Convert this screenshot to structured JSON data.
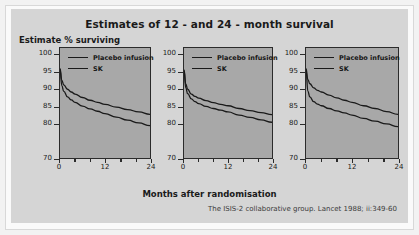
{
  "figure": {
    "title": "Estimates of 12 - and 24 - month survival",
    "ylabel": "Estimate % surviving",
    "xlabel": "Months after randomisation",
    "citation": "The ISIS-2 collaborative group. Lancet 1988; ii:349-60",
    "background_color": "#d5d5d5",
    "plot_background_color": "#a8a8a8",
    "line_color": "#1a1a1a"
  },
  "chart_data": [
    {
      "type": "line",
      "panel": 1,
      "title": "Estimates of 12 - and 24 - month survival",
      "xlabel": "Months after randomisation",
      "ylabel": "Estimate % surviving",
      "xlim": [
        0,
        24
      ],
      "ylim": [
        70,
        102
      ],
      "xticks": [
        0,
        4,
        8,
        12,
        16,
        20,
        24
      ],
      "xticklabels": [
        "0",
        "",
        "",
        "12",
        "",
        "",
        "24"
      ],
      "yticks": [
        70,
        80,
        85,
        90,
        95,
        100
      ],
      "yticklabels": [
        "70",
        "80",
        "85",
        "90",
        "95",
        "100"
      ],
      "grid": false,
      "legend_position": "top-left",
      "series": [
        {
          "name": "Placebo infusion",
          "x": [
            0,
            0.5,
            1,
            2,
            3,
            4,
            6,
            8,
            10,
            12,
            15,
            18,
            21,
            24
          ],
          "values": [
            96.0,
            92.6,
            91.3,
            90.0,
            89.2,
            88.6,
            87.6,
            86.8,
            86.2,
            85.6,
            84.8,
            84.1,
            83.4,
            82.7
          ]
        },
        {
          "name": "SK",
          "x": [
            0,
            0.5,
            1,
            2,
            3,
            4,
            6,
            8,
            10,
            12,
            15,
            18,
            21,
            24
          ],
          "values": [
            95.8,
            91.0,
            89.4,
            87.8,
            86.9,
            86.2,
            85.1,
            84.3,
            83.6,
            82.9,
            81.9,
            81.0,
            80.2,
            79.4
          ]
        }
      ]
    },
    {
      "type": "line",
      "panel": 2,
      "xlim": [
        0,
        24
      ],
      "ylim": [
        70,
        102
      ],
      "xticks": [
        0,
        4,
        8,
        12,
        16,
        20,
        24
      ],
      "xticklabels": [
        "0",
        "",
        "",
        "12",
        "",
        "",
        "24"
      ],
      "yticks": [
        70,
        80,
        85,
        90,
        95,
        100
      ],
      "yticklabels": [
        "70",
        "80",
        "85",
        "90",
        "95",
        "100"
      ],
      "grid": false,
      "legend_position": "top-left",
      "series": [
        {
          "name": "Placebo infusion",
          "x": [
            0,
            0.5,
            1,
            2,
            3,
            4,
            6,
            8,
            10,
            12,
            15,
            18,
            21,
            24
          ],
          "values": [
            95.6,
            91.5,
            90.0,
            88.6,
            87.9,
            87.4,
            86.7,
            86.1,
            85.6,
            85.2,
            84.4,
            83.8,
            83.2,
            82.6
          ]
        },
        {
          "name": "SK",
          "x": [
            0,
            0.5,
            1,
            2,
            3,
            4,
            6,
            8,
            10,
            12,
            15,
            18,
            21,
            24
          ],
          "values": [
            95.4,
            90.4,
            88.7,
            87.2,
            86.4,
            85.8,
            85.0,
            84.4,
            83.9,
            83.4,
            82.5,
            81.8,
            81.1,
            80.4
          ]
        }
      ]
    },
    {
      "type": "line",
      "panel": 3,
      "xlim": [
        0,
        24
      ],
      "ylim": [
        70,
        102
      ],
      "xticks": [
        0,
        4,
        8,
        12,
        16,
        20,
        24
      ],
      "xticklabels": [
        "0",
        "",
        "",
        "12",
        "",
        "",
        "24"
      ],
      "yticks": [
        70,
        80,
        85,
        90,
        95,
        100
      ],
      "yticklabels": [
        "70",
        "80",
        "85",
        "90",
        "95",
        "100"
      ],
      "grid": false,
      "legend_position": "top-left",
      "series": [
        {
          "name": "Placebo infusion",
          "x": [
            0,
            0.5,
            1,
            2,
            3,
            4,
            6,
            8,
            10,
            12,
            15,
            18,
            21,
            24
          ],
          "values": [
            96.0,
            92.8,
            91.6,
            90.4,
            89.7,
            89.2,
            88.3,
            87.5,
            86.8,
            86.2,
            85.2,
            84.4,
            83.5,
            82.7
          ]
        },
        {
          "name": "SK",
          "x": [
            0,
            0.5,
            1,
            2,
            3,
            4,
            6,
            8,
            10,
            12,
            15,
            18,
            21,
            24
          ],
          "values": [
            95.6,
            89.4,
            87.8,
            86.4,
            85.7,
            85.2,
            84.4,
            83.7,
            83.1,
            82.5,
            81.5,
            80.7,
            79.9,
            79.1
          ]
        }
      ]
    }
  ],
  "legend": {
    "placebo_label": "Placebo infusion",
    "sk_label": "SK"
  }
}
